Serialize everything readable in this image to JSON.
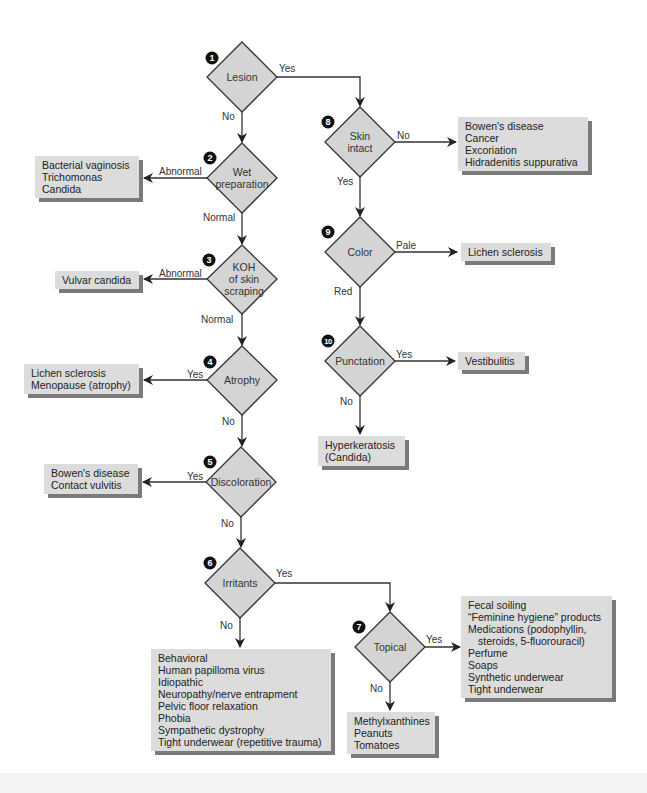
{
  "diagram": {
    "type": "flowchart",
    "colors": {
      "diamond_fill": "#d4d4d4",
      "box_fill": "#dcdcdc",
      "box_shadow": "#7a7a7a",
      "line": "#333333",
      "badge": "#111111"
    },
    "nodes": [
      {
        "id": 1,
        "badge": "1",
        "label": "Lesion"
      },
      {
        "id": 2,
        "badge": "2",
        "label": "Wet\npreparation"
      },
      {
        "id": 3,
        "badge": "3",
        "label": "KOH\nof skin\nscraping"
      },
      {
        "id": 4,
        "badge": "4",
        "label": "Atrophy"
      },
      {
        "id": 5,
        "badge": "5",
        "label": "Discoloration"
      },
      {
        "id": 6,
        "badge": "6",
        "label": "Irritants"
      },
      {
        "id": 7,
        "badge": "7",
        "label": "Topical"
      },
      {
        "id": 8,
        "badge": "8",
        "label": "Skin\nintact"
      },
      {
        "id": 9,
        "badge": "9",
        "label": "Color"
      },
      {
        "id": 10,
        "badge": "10",
        "label": "Punctation"
      }
    ],
    "edge_labels": {
      "lesion_yes": "Yes",
      "lesion_no": "No",
      "wet_abnormal": "Abnormal",
      "wet_normal": "Normal",
      "koh_abnormal": "Abnormal",
      "koh_normal": "Normal",
      "atrophy_yes": "Yes",
      "atrophy_no": "No",
      "discoloration_yes": "Yes",
      "discoloration_no": "No",
      "irritants_yes": "Yes",
      "irritants_no": "No",
      "topical_yes": "Yes",
      "topical_no": "No",
      "skin_no": "No",
      "skin_yes": "Yes",
      "color_pale": "Pale",
      "color_red": "Red",
      "punctation_yes": "Yes",
      "punctation_no": "No"
    },
    "outcomes": {
      "wet_abnormal": [
        "Bacterial vaginosis",
        "Trichomonas",
        "Candida"
      ],
      "koh_abnormal": [
        "Vulvar candida"
      ],
      "atrophy_yes": [
        "Lichen sclerosis",
        "Menopause (atrophy)"
      ],
      "discoloration_yes": [
        "Bowen's disease",
        "Contact vulvitis"
      ],
      "irritants_no": [
        "Behavioral",
        "Human papilloma virus",
        "Idiopathic",
        "Neuropathy/nerve entrapment",
        "Pelvic floor relaxation",
        "Phobia",
        "Sympathetic dystrophy",
        "Tight underwear (repetitive trauma)"
      ],
      "topical_no": [
        "Methylxanthines",
        "Peanuts",
        "Tomatoes"
      ],
      "topical_yes": [
        "Fecal soiling",
        "“Feminine hygiene” products",
        "Medications (podophyllin,",
        "steroids, 5-fluorouracil)",
        "Perfume",
        "Soaps",
        "Synthetic underwear",
        "Tight underwear"
      ],
      "skin_no": [
        "Bowen's disease",
        "Cancer",
        "Excoriation",
        "Hidradenitis suppurativa"
      ],
      "color_pale": [
        "Lichen sclerosis"
      ],
      "punctation_yes": [
        "Vestibulitis"
      ],
      "punctation_no": [
        "Hyperkeratosis",
        "(Candida)"
      ]
    }
  }
}
